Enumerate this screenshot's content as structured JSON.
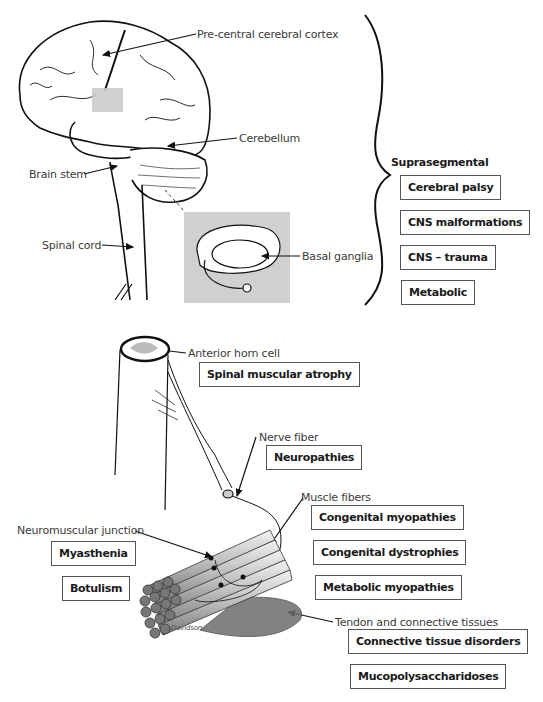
{
  "diagram": {
    "type": "anatomical-diagram",
    "structures": {
      "precentral_cortex": "Pre-central cerebral cortex",
      "cerebellum": "Cerebellum",
      "brain_stem": "Brain stem",
      "spinal_cord": "Spinal cord",
      "basal_ganglia": "Basal ganglia",
      "anterior_horn_cell": "Anterior horn cell",
      "nerve_fiber": "Nerve fiber",
      "muscle_fibers": "Muscle fibers",
      "neuromuscular_junction": "Neuromuscular junction",
      "tendon": "Tendon and connective tissues"
    },
    "suprasegmental": {
      "heading": "Suprasegmental",
      "disorders": [
        "Cerebral palsy",
        "CNS malformations",
        "CNS – trauma",
        "Metabolic"
      ]
    },
    "anterior_horn_disorders": [
      "Spinal muscular atrophy"
    ],
    "nerve_disorders": [
      "Neuropathies"
    ],
    "nmj_disorders": [
      "Myasthenia",
      "Botulism"
    ],
    "muscle_disorders": [
      "Congenital myopathies",
      "Congenital dystrophies",
      "Metabolic myopathies"
    ],
    "connective_disorders": [
      "Connective tissue disorders",
      "Mucopolysaccharidoses"
    ],
    "signature": "Davidson"
  }
}
